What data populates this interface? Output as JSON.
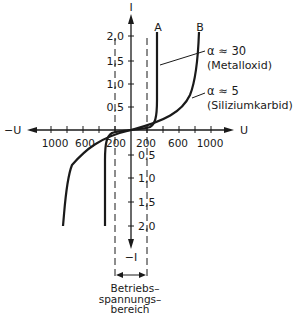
{
  "diagram": {
    "axes": {
      "y_pos_label": "I",
      "y_neg_label": "−I",
      "x_pos_label": "U",
      "x_neg_label": "−U"
    },
    "y_ticks_pos": [
      "2,0",
      "1,5",
      "1,0",
      "0,5"
    ],
    "y_ticks_neg": [
      "0,5",
      "1,0",
      "1,5",
      "2,0"
    ],
    "x_ticks_pos": [
      "200",
      "600",
      "1000"
    ],
    "x_ticks_neg": [
      "1000",
      "600",
      "200"
    ],
    "curves": [
      {
        "id": "A",
        "label": "A",
        "alpha": "α ≈ 30",
        "material": "(Metalloxid)"
      },
      {
        "id": "B",
        "label": "B",
        "alpha": "α ≈ 5",
        "material": "(Siliziumkarbid)"
      }
    ],
    "operating_range": {
      "line1": "Betriebs–",
      "line2": "spannungs–",
      "line3": "bereich"
    }
  }
}
